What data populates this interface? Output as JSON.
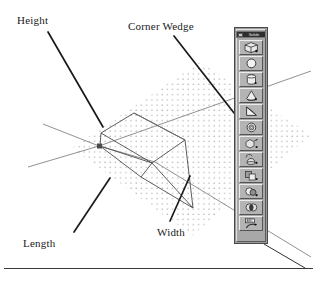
{
  "figure": {
    "labels": {
      "height": "Height",
      "corner_wedge": "Corner Wedge",
      "length": "Length",
      "width": "Width"
    },
    "colors": {
      "ink": "#1a1a1a",
      "geometry_line": "#4b4b4b",
      "axis_line": "#6e6e6e",
      "ground_dots": "#8a8a8a",
      "toolbar_face": "#a8a8a8",
      "toolbar_button": "#b4b4b4",
      "titlebar": "#2e2e2e",
      "rule": "#3a3a3a"
    }
  },
  "toolbar": {
    "title": "Solids",
    "icons": [
      {
        "name": "box-solid-icon",
        "label": "Box"
      },
      {
        "name": "sphere-icon",
        "label": "Sphere"
      },
      {
        "name": "cylinder-icon",
        "label": "Cylinder"
      },
      {
        "name": "cone-icon",
        "label": "Cone"
      },
      {
        "name": "corner-wedge-icon",
        "label": "Corner Wedge"
      },
      {
        "name": "torus-icon",
        "label": "Torus"
      },
      {
        "name": "extrude-icon",
        "label": "Extrude"
      },
      {
        "name": "revolve-icon",
        "label": "Revolve"
      },
      {
        "name": "union-icon",
        "label": "Union"
      },
      {
        "name": "subtract-icon",
        "label": "Subtract"
      },
      {
        "name": "intersect-icon",
        "label": "Intersect"
      },
      {
        "name": "slice-icon",
        "label": "Slice"
      }
    ]
  }
}
